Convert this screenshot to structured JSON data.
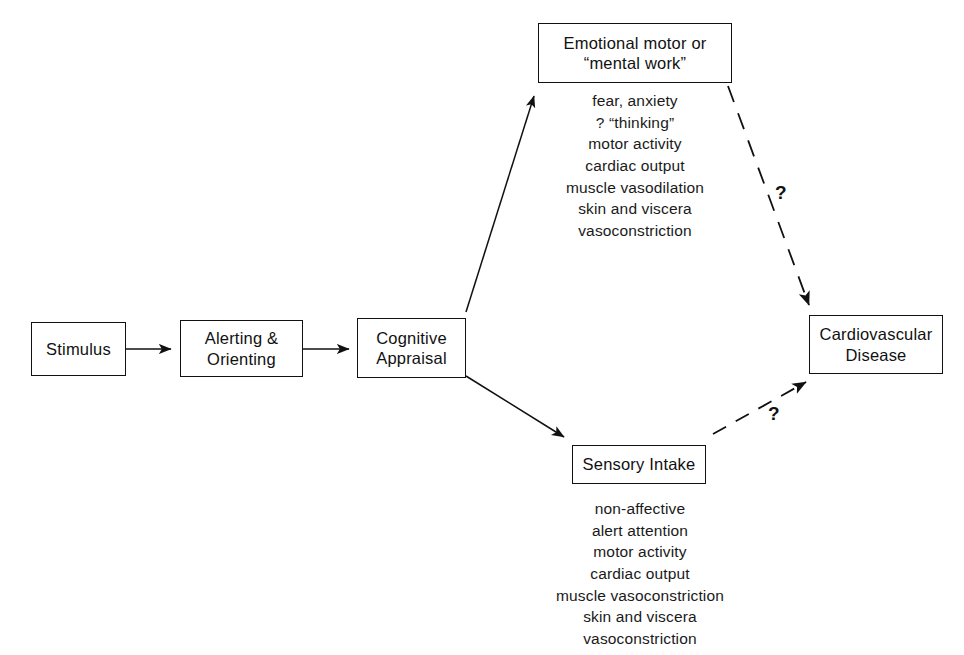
{
  "diagram": {
    "background_color": "#ffffff",
    "line_color": "#111111",
    "text_color": "#1a1a1a"
  },
  "nodes": {
    "stimulus": {
      "label": "Stimulus"
    },
    "alerting": {
      "line1": "Alerting  &",
      "line2": "Orienting"
    },
    "cognitive": {
      "line1": "Cognitive",
      "line2": "Appraisal"
    },
    "emotional": {
      "line1": "Emotional motor or",
      "line2": "“mental work”"
    },
    "sensory": {
      "label": "Sensory Intake"
    },
    "cardiovascular": {
      "line1": "Cardiovascular",
      "line2": "Disease"
    }
  },
  "lists": {
    "emotional_effects": [
      "fear, anxiety",
      "? “thinking”",
      "motor activity",
      "cardiac output",
      "muscle vasodilation",
      "skin and viscera",
      "vasoconstriction"
    ],
    "sensory_effects": [
      "non-affective",
      "alert attention",
      "motor activity",
      "cardiac output",
      "muscle vasoconstriction",
      "skin and viscera",
      "vasoconstriction"
    ]
  },
  "annotations": {
    "upper_question": "?",
    "lower_question": "?"
  },
  "edges": [
    {
      "name": "stimulus-to-alerting",
      "style": "solid"
    },
    {
      "name": "alerting-to-cognitive",
      "style": "solid"
    },
    {
      "name": "cognitive-to-emotional",
      "style": "solid"
    },
    {
      "name": "cognitive-to-sensory",
      "style": "solid"
    },
    {
      "name": "emotional-to-cardiovascular",
      "style": "dashed"
    },
    {
      "name": "sensory-to-cardiovascular",
      "style": "dashed"
    }
  ]
}
